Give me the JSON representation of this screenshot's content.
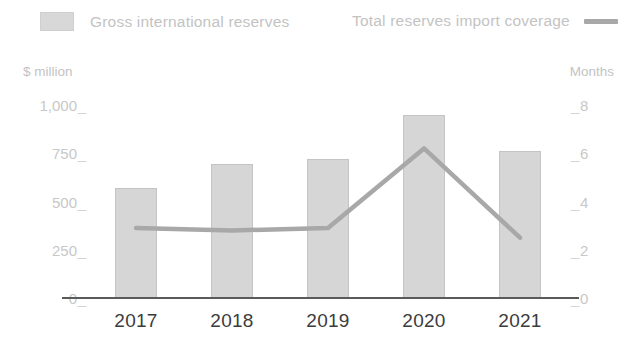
{
  "chart_data": {
    "type": "bar",
    "title": "",
    "subtitle": "",
    "categories": [
      "2017",
      "2018",
      "2019",
      "2020",
      "2021"
    ],
    "xlabel": "",
    "ylabel": "$ million",
    "y2label": "Months",
    "ylim": [
      0,
      1000
    ],
    "y2lim": [
      0,
      8
    ],
    "yticks": [
      "0",
      "250",
      "500",
      "750",
      "1,000"
    ],
    "ytick_values": [
      0,
      250,
      500,
      750,
      1000
    ],
    "y2ticks": [
      "0",
      "2",
      "4",
      "6",
      "8"
    ],
    "y2tick_values": [
      0,
      2,
      4,
      6,
      8
    ],
    "grid": false,
    "legend_position": "top",
    "series": [
      {
        "name": "Gross international reserves",
        "type": "bar",
        "axis": "left",
        "unit": "$ million",
        "color": "#d6d6d6",
        "values": [
          570,
          695,
          720,
          950,
          760
        ]
      },
      {
        "name": "Total reserves import coverage",
        "type": "line",
        "axis": "right",
        "unit": "Months",
        "color": "#a8a8a8",
        "values": [
          2.9,
          2.8,
          2.9,
          6.2,
          2.5
        ]
      }
    ]
  },
  "legend": {
    "bars_label": "Gross international reserves",
    "line_label": "Total reserves import coverage",
    "bars_swatch_icon": "square-swatch-icon",
    "line_swatch_icon": "line-swatch-icon"
  },
  "axes": {
    "left_title": "$ million",
    "right_title": "Months"
  },
  "colors": {
    "bar_fill": "#d6d6d6",
    "bar_border": "#c4c4c4",
    "line": "#a8a8a8",
    "axis_line": "#5a5a5a",
    "tick_label": "#c8c8c8",
    "category_label": "#3c3c3c",
    "legend_label": "#c3c3c3",
    "background": "#ffffff"
  }
}
